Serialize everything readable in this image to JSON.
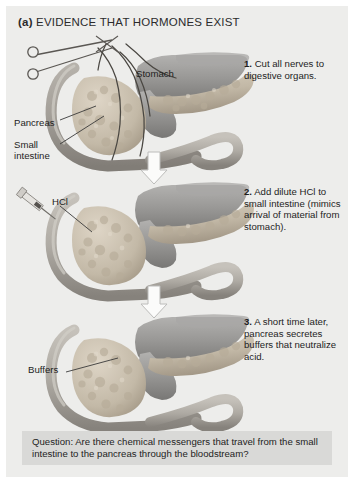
{
  "figure": {
    "panel_tag": "(a)",
    "title": "EVIDENCE THAT HORMONES EXIST",
    "background_color": "#ededeb",
    "page_color": "#ffffff"
  },
  "steps": [
    {
      "number": "1.",
      "text": " Cut all nerves to digestive organs.",
      "full": "1. Cut all nerves to digestive organs."
    },
    {
      "number": "2.",
      "text": " Add dilute HCl to small intestine (mimics arrival of material from stomach).",
      "full": "2. Add dilute HCl to small intestine (mimics arrival of material from stomach)."
    },
    {
      "number": "3.",
      "text": " A short time later, pancreas secretes buffers that neutralize acid.",
      "full": "3. A short time later, pancreas secretes buffers that neutralize acid."
    }
  ],
  "labels": {
    "stomach": "Stomach",
    "pancreas": "Pancreas",
    "small_intestine": "Small\nintestine",
    "hcl": "HCl",
    "buffers": "Buffers"
  },
  "question": {
    "text": "Question: Are there chemical messengers that travel from the small intestine to the pancreas through the bloodstream?",
    "background_color": "#d9d9d7"
  },
  "colors": {
    "stomach": "#9b9a99",
    "stomach_shadow": "#7e7d7c",
    "pancreas": "#c9bfae",
    "pancreas_dark": "#a89e8d",
    "intestine": "#b5b1aa",
    "intestine_dark": "#8e8a84",
    "nerve": "#4a4742",
    "arrow_fill": "#fbfbfa",
    "arrow_stroke": "#bcbcba",
    "text": "#1d1d1d"
  },
  "icons": {
    "scissors": "scissors-icon",
    "syringe": "syringe-icon",
    "arrow_down_1": "arrow-down-icon",
    "arrow_down_2": "arrow-down-icon"
  }
}
